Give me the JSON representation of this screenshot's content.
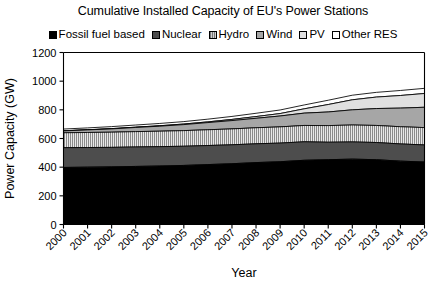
{
  "chart_data": {
    "type": "area",
    "title": "Cumulative Installed Capacity of EU's Power Stations",
    "xlabel": "Year",
    "ylabel": "Power Capacity (GW)",
    "ylim": [
      0,
      1200
    ],
    "ytick_step": 200,
    "yticks": [
      "0",
      "200",
      "400",
      "600",
      "800",
      "1000",
      "1200"
    ],
    "grid": false,
    "stacked": true,
    "legend_position": "top",
    "categories": [
      "2000",
      "2001",
      "2002",
      "2003",
      "2004",
      "2005",
      "2006",
      "2007",
      "2008",
      "2009",
      "2010",
      "2011",
      "2012",
      "2013",
      "2014",
      "2015"
    ],
    "series": [
      {
        "name": "Fossil fuel based",
        "fill": "#000000",
        "pattern": "solid",
        "values": [
          398,
          400,
          402,
          405,
          408,
          412,
          418,
          424,
          432,
          438,
          448,
          452,
          456,
          452,
          442,
          436
        ]
      },
      {
        "name": "Nuclear",
        "fill": "#4d4d4d",
        "pattern": "solid",
        "values": [
          138,
          137,
          136,
          136,
          135,
          134,
          133,
          132,
          131,
          130,
          129,
          122,
          120,
          120,
          120,
          119
        ]
      },
      {
        "name": "Hydro",
        "fill": "#d0d0d0",
        "pattern": "vertical-lines",
        "values": [
          104,
          105,
          106,
          107,
          108,
          109,
          110,
          111,
          112,
          113,
          114,
          116,
          118,
          119,
          120,
          121
        ]
      },
      {
        "name": "Wind",
        "fill": "#a6a6a6",
        "pattern": "solid",
        "values": [
          13,
          18,
          23,
          29,
          35,
          42,
          50,
          58,
          66,
          76,
          86,
          95,
          106,
          118,
          130,
          142
        ]
      },
      {
        "name": "PV",
        "fill": "#e0e0e0",
        "pattern": "solid",
        "values": [
          1,
          1,
          2,
          2,
          3,
          4,
          5,
          8,
          12,
          17,
          30,
          52,
          70,
          80,
          88,
          96
        ]
      },
      {
        "name": "Other RES",
        "fill": "#ffffff",
        "pattern": "solid",
        "values": [
          12,
          13,
          14,
          15,
          16,
          17,
          19,
          21,
          23,
          25,
          27,
          30,
          32,
          33,
          35,
          36
        ]
      }
    ]
  }
}
